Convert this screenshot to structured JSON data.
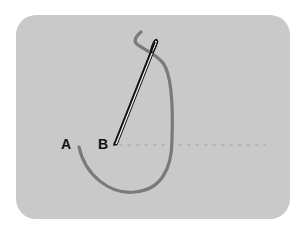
{
  "diagram": {
    "labels": {
      "a": "A",
      "b": "B"
    },
    "colors": {
      "background": "#ffffff",
      "panel": "#c9c9c9",
      "thread": "#7a7a7a",
      "needle": "#111111",
      "stitch_line_dots": "#b4b4b4"
    },
    "elements": [
      "thread loop from point A down and up to needle eye",
      "needle from point B to upper right",
      "dotted stitch line from B to the right"
    ]
  }
}
